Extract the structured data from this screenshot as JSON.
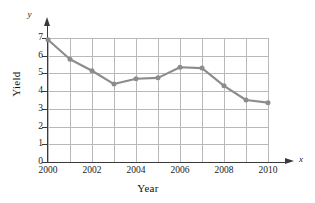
{
  "chart_data": {
    "type": "line",
    "title": "",
    "xlabel": "Year",
    "ylabel": "Yield",
    "axis_name_x": "x",
    "axis_name_y": "y",
    "x": [
      2000,
      2001,
      2002,
      2003,
      2004,
      2005,
      2006,
      2007,
      2008,
      2009,
      2010
    ],
    "values": [
      6.9,
      5.8,
      5.15,
      4.4,
      4.7,
      4.75,
      5.35,
      5.3,
      4.3,
      3.5,
      3.35
    ],
    "series": [
      {
        "name": "Yield",
        "values": [
          6.9,
          5.8,
          5.15,
          4.4,
          4.7,
          4.75,
          5.35,
          5.3,
          4.3,
          3.5,
          3.35
        ]
      }
    ],
    "xlim": [
      2000,
      2010
    ],
    "ylim": [
      0,
      7
    ],
    "x_tick_labels": [
      "2000",
      "2002",
      "2004",
      "2006",
      "2008",
      "2010"
    ],
    "x_tick_values": [
      2000,
      2002,
      2004,
      2006,
      2008,
      2010
    ],
    "x_gridline_values": [
      2000,
      2001,
      2002,
      2003,
      2004,
      2005,
      2006,
      2007,
      2008,
      2009,
      2010
    ],
    "y_tick_labels": [
      "0",
      "1",
      "2",
      "3",
      "4",
      "5",
      "6",
      "7"
    ],
    "y_tick_values": [
      0,
      1,
      2,
      3,
      4,
      5,
      6,
      7
    ],
    "grid": true,
    "legend": false,
    "legend_position": "none",
    "marker": "circle",
    "line_color": "#8c8c8c",
    "marker_color": "#8c8c8c",
    "grid_color": "#b9b9b9",
    "axis_color": "#3a3a3a",
    "background_color": "#ffffff"
  }
}
